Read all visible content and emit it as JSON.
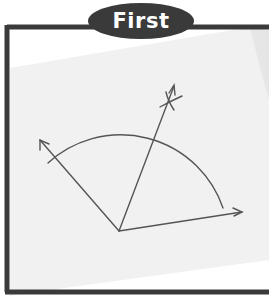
{
  "label": {
    "text": "First"
  },
  "colors": {
    "frame": "#3a3a3a",
    "paper": "#f1f1f1",
    "background": "#ffffff",
    "ink": "#555555",
    "label_bg": "#3a3a3a",
    "label_text": "#ffffff"
  },
  "diagram": {
    "vertex": [
      119,
      231
    ],
    "rays": [
      {
        "name": "left-ray",
        "to": [
          40,
          140
        ],
        "arrow": true
      },
      {
        "name": "right-ray",
        "to": [
          242,
          212
        ],
        "arrow": true
      },
      {
        "name": "bisector",
        "to": [
          176,
          82
        ],
        "arrow": true
      }
    ],
    "arc": {
      "center": [
        119,
        231
      ],
      "radius": 105
    },
    "construction_marks": "crossing arcs near bisector tip"
  }
}
